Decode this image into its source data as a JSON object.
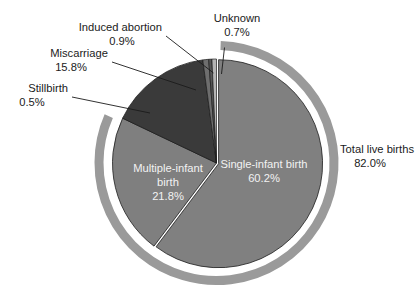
{
  "chart_data": {
    "type": "pie",
    "title": "",
    "subtitle": "",
    "xlabel": "",
    "ylabel": "",
    "legend_position": "none",
    "grid": false,
    "units": "percent",
    "total": 99.9,
    "categories": [
      "Single-infant birth",
      "Multiple-infant birth",
      "Miscarriage",
      "Induced abortion",
      "Stillbirth",
      "Unknown"
    ],
    "values": [
      60.2,
      21.8,
      15.8,
      0.9,
      0.5,
      0.7
    ],
    "slices": [
      {
        "label": "Single-infant birth",
        "value": 60.2,
        "value_text": "60.2%",
        "color": "#808080",
        "label_placement": "inside",
        "label_color": "#f2f2f2"
      },
      {
        "label": "Multiple-infant birth",
        "value": 21.8,
        "value_text": "21.8%",
        "color": "#7f7f7f",
        "label_placement": "inside",
        "label_color": "#f2f2f2"
      },
      {
        "label": "Miscarriage",
        "value": 15.8,
        "value_text": "15.8%",
        "color": "#3a3a3a",
        "label_placement": "outside-left",
        "label_color": "#1b1b1b"
      },
      {
        "label": "Induced abortion",
        "value": 0.9,
        "value_text": "0.9%",
        "color": "#6e6e6e",
        "label_placement": "outside-left",
        "label_color": "#1b1b1b"
      },
      {
        "label": "Stillbirth",
        "value": 0.5,
        "value_text": "0.5%",
        "color": "#565656",
        "label_placement": "outside-left",
        "label_color": "#1b1b1b"
      },
      {
        "label": "Unknown",
        "value": 0.7,
        "value_text": "0.7%",
        "color": "#b4b4b4",
        "label_placement": "outside-top",
        "label_color": "#1b1b1b"
      }
    ],
    "annotations": [
      {
        "name": "total-live-births",
        "label": "Total live births",
        "value": 82.0,
        "value_text": "82.0%",
        "kind": "outer-arc-bracket",
        "covers": [
          "Single-infant birth",
          "Multiple-infant birth"
        ],
        "color": "#9a9a9a"
      }
    ]
  },
  "labels": {
    "unknown": {
      "name": "Unknown",
      "pct": "0.7%"
    },
    "induced_abortion": {
      "name": "Induced abortion",
      "pct": "0.9%"
    },
    "miscarriage": {
      "name": "Miscarriage",
      "pct": "15.8%"
    },
    "stillbirth": {
      "name": "Stillbirth",
      "pct": "0.5%"
    },
    "total_live_births": {
      "name": "Total live births",
      "pct": "82.0%"
    },
    "single_infant": {
      "line1": "Single-infant birth",
      "pct": "60.2%"
    },
    "multiple_infant": {
      "line1": "Multiple-infant",
      "line2": "birth",
      "pct": "21.8%"
    }
  },
  "colors": {
    "background": "#ffffff",
    "slice_light": "#808080",
    "slice_dark": "#3a3a3a",
    "slice_thin_mid": "#6e6e6e",
    "slice_thin_pale": "#b4b4b4",
    "outer_ring": "#9a9a9a",
    "text_dark": "#1b1b1b",
    "text_light": "#f2f2f2"
  }
}
